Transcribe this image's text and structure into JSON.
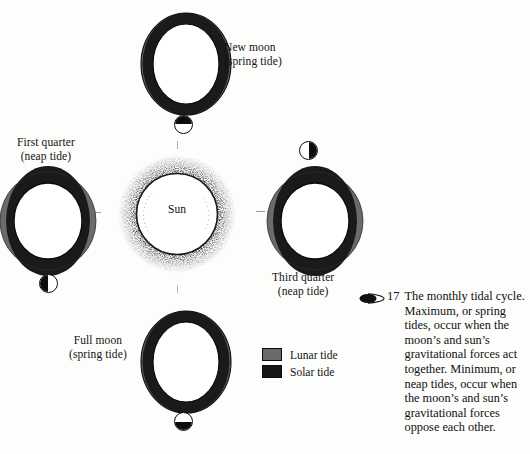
{
  "figure": {
    "title_marker_icon": "lens-marker-icon",
    "number": "17",
    "caption": "The monthly tidal cycle. Maximum, or spring tides, occur when the moon’s and sun’s gravitational forces act together. Minimum, or neap tides, occur when the moon’s and sun’s gravitational forces oppose each other."
  },
  "center": {
    "label": "Sun",
    "icon": "sun-icon"
  },
  "positions": [
    {
      "key": "new-moon",
      "line1": "New moon",
      "line2": "(spring tide)",
      "tide_type": "spring",
      "phase_icon": "new-moon-phase-icon"
    },
    {
      "key": "first-quarter",
      "line1": "First quarter",
      "line2": "(neap tide)",
      "tide_type": "neap",
      "phase_icon": "first-quarter-phase-icon"
    },
    {
      "key": "third-quarter",
      "line1": "Third quarter",
      "line2": "(neap tide)",
      "tide_type": "neap",
      "phase_icon": "third-quarter-phase-icon"
    },
    {
      "key": "full-moon",
      "line1": "Full moon",
      "line2": "(spring tide)",
      "tide_type": "spring",
      "phase_icon": "full-moon-phase-icon"
    }
  ],
  "legend": {
    "items": [
      {
        "label": "Lunar tide",
        "color": "#6b6b6b",
        "swatch_icon": "lunar-tide-swatch"
      },
      {
        "label": "Solar tide",
        "color": "#161616",
        "swatch_icon": "solar-tide-swatch"
      }
    ]
  },
  "colors": {
    "solar_tide": "#161616",
    "lunar_tide": "#6b6b6b",
    "outline": "#0d0d0d",
    "text": "#111111",
    "background": "#fdfdfc"
  }
}
